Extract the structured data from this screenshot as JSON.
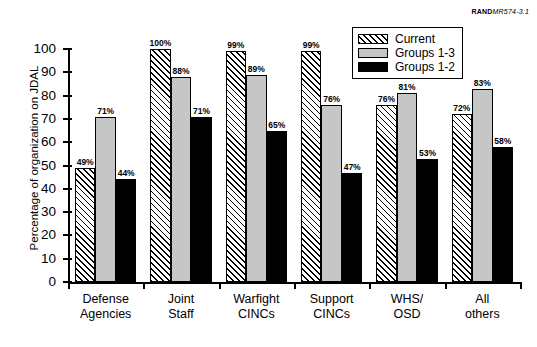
{
  "credit": {
    "brand": "RAND",
    "ref": "MR574-3.1"
  },
  "chart_data": {
    "type": "bar",
    "title": "",
    "xlabel": "",
    "ylabel": "Percentage of organization on JDAL",
    "ylim": [
      0,
      100
    ],
    "ytick_step": 10,
    "ytick_labels": [
      "100",
      "90",
      "80",
      "70",
      "60",
      "50",
      "40",
      "30",
      "20",
      "10",
      "0"
    ],
    "grid": false,
    "legend_position": "top-right",
    "value_suffix": "%",
    "categories": [
      "Defense Agencies",
      "Joint Staff",
      "Warfight CINCs",
      "Support CINCs",
      "WHS/ OSD",
      "All others"
    ],
    "category_lines": [
      [
        "Defense",
        "Agencies"
      ],
      [
        "Joint",
        "Staff"
      ],
      [
        "Warfight",
        "CINCs"
      ],
      [
        "Support",
        "CINCs"
      ],
      [
        "WHS/",
        "OSD"
      ],
      [
        "All",
        "others"
      ]
    ],
    "series": [
      {
        "name": "Current",
        "style": "hatched",
        "color": "#ffffff",
        "values": [
          49,
          100,
          99,
          99,
          76,
          72
        ],
        "labels": [
          "49%",
          "100%",
          "99%",
          "99%",
          "76%",
          "72%"
        ]
      },
      {
        "name": "Groups 1-3",
        "style": "solid",
        "color": "#c6c6c6",
        "values": [
          71,
          88,
          89,
          76,
          81,
          83
        ],
        "labels": [
          "71%",
          "88%",
          "89%",
          "76%",
          "81%",
          "83%"
        ]
      },
      {
        "name": "Groups 1-2",
        "style": "solid",
        "color": "#000000",
        "values": [
          44,
          71,
          65,
          47,
          53,
          58
        ],
        "labels": [
          "44%",
          "71%",
          "65%",
          "47%",
          "53%",
          "58%"
        ]
      }
    ]
  }
}
